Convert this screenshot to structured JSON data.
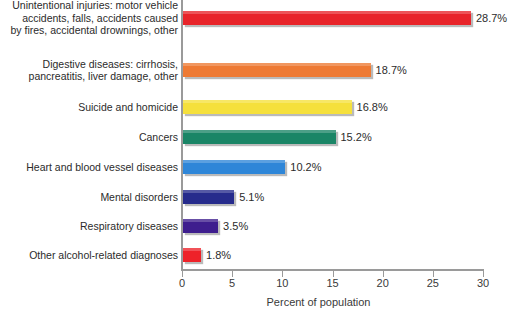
{
  "chart_data": {
    "type": "bar",
    "orientation": "horizontal",
    "title": "",
    "xlabel": "Percent of population",
    "ylabel": "",
    "xlim": [
      0,
      30
    ],
    "xticks": [
      0,
      5,
      10,
      15,
      20,
      25,
      30
    ],
    "xtick_labels": [
      "0",
      "5",
      "10",
      "15",
      "20",
      "25",
      "30"
    ],
    "grid": false,
    "legend": false,
    "value_suffix": "%",
    "categories": [
      "Unintentional injuries: motor vehicle\naccidents, falls, accidents caused\nby fires, accidental drownings, other",
      "Digestive diseases: cirrhosis,\npancreatitis, liver damage, other",
      "Suicide and homicide",
      "Cancers",
      "Heart and blood vessel diseases",
      "Mental disorders",
      "Respiratory diseases",
      "Other alcohol-related diagnoses"
    ],
    "values": [
      28.7,
      18.7,
      16.8,
      15.2,
      10.2,
      5.1,
      3.5,
      1.8
    ],
    "value_labels": [
      "28.7%",
      "18.7%",
      "16.8%",
      "15.2%",
      "10.2%",
      "5.1%",
      "3.5%",
      "1.8%"
    ],
    "colors": [
      "#e8242a",
      "#ee7a34",
      "#f5e03c",
      "#1a8566",
      "#2e86d8",
      "#262b8c",
      "#3e1e8e",
      "#ee2229"
    ]
  },
  "axis": {
    "line_color": "#9a9a9a"
  }
}
